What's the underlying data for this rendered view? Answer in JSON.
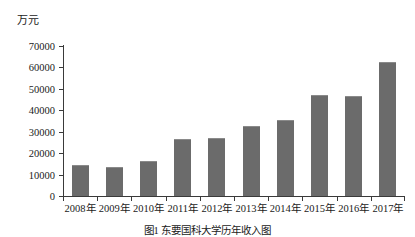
{
  "figure": {
    "y_axis_unit": "万元",
    "caption": "图1  东要国科大学历年收入图"
  },
  "chart_data": {
    "type": "bar",
    "title": "",
    "subtitle": "",
    "xlabel": "",
    "ylabel": "万元",
    "categories": [
      "2008年",
      "2009年",
      "2010年",
      "2011年",
      "2012年",
      "2013年",
      "2014年",
      "2015年",
      "2016年",
      "2017年"
    ],
    "values": [
      14500,
      13500,
      16500,
      26500,
      27000,
      32500,
      35500,
      47000,
      46500,
      62500
    ],
    "ylim": [
      0,
      70000
    ],
    "ytick_labels": [
      "0",
      "10000",
      "20000",
      "30000",
      "40000",
      "50000",
      "60000",
      "70000"
    ],
    "ytick_values": [
      0,
      10000,
      20000,
      30000,
      40000,
      50000,
      60000,
      70000
    ],
    "grid": false,
    "legend": null,
    "legend_position": "none",
    "bar_color": "#6b6b6b",
    "axis_color": "#3a3a3a"
  }
}
